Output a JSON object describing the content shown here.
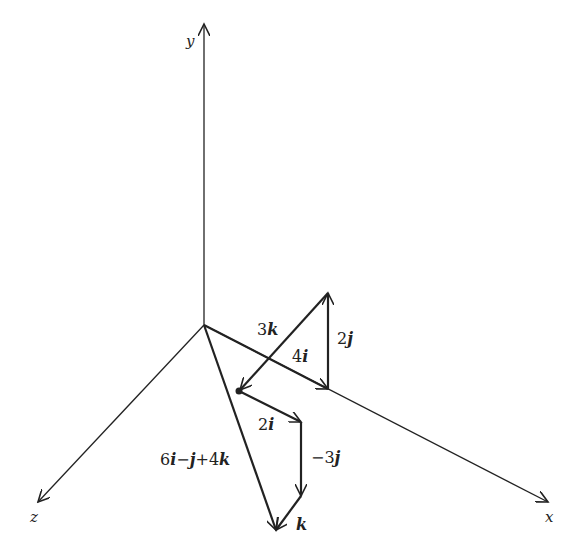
{
  "diagram": {
    "type": "3d-vector-addition",
    "axes": {
      "x": {
        "label": "x"
      },
      "y": {
        "label": "y"
      },
      "z": {
        "label": "z"
      }
    },
    "vectors": [
      {
        "id": "4i",
        "coef": "4",
        "unit": "i",
        "label": "4i"
      },
      {
        "id": "2j",
        "coef": "2",
        "unit": "j",
        "label": "2j"
      },
      {
        "id": "3k",
        "coef": "3",
        "unit": "k",
        "label": "3k"
      },
      {
        "id": "2i",
        "coef": "2",
        "unit": "i",
        "label": "2i"
      },
      {
        "id": "-3j",
        "coef": "−3",
        "unit": "j",
        "label": "−3j"
      },
      {
        "id": "k",
        "coef": "",
        "unit": "k",
        "label": "k"
      }
    ],
    "resultant": {
      "label": "6i−j+4k",
      "parts": [
        "6",
        "i",
        "−",
        "j",
        "+4",
        "k"
      ]
    },
    "colors": {
      "line": "#222222",
      "background": "#ffffff"
    }
  }
}
